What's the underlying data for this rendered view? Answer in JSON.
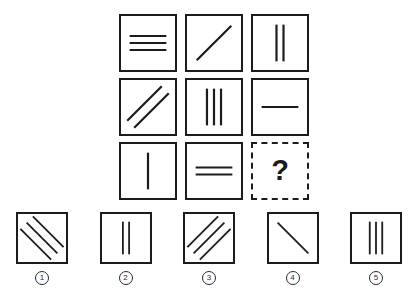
{
  "puzzle": {
    "type": "matrix-reasoning",
    "question_mark": "?",
    "matrix": {
      "rows": 3,
      "cols": 3,
      "cells": [
        {
          "id": "cell-r1c1",
          "orientation": "horizontal",
          "count": 3,
          "label": "3 horizontal lines"
        },
        {
          "id": "cell-r1c2",
          "orientation": "diagonal-up",
          "count": 1,
          "label": "1 diagonal line"
        },
        {
          "id": "cell-r1c3",
          "orientation": "vertical",
          "count": 2,
          "label": "2 vertical lines"
        },
        {
          "id": "cell-r2c1",
          "orientation": "diagonal-up",
          "count": 2,
          "label": "2 diagonal lines"
        },
        {
          "id": "cell-r2c2",
          "orientation": "vertical",
          "count": 3,
          "label": "3 vertical lines"
        },
        {
          "id": "cell-r2c3",
          "orientation": "horizontal",
          "count": 1,
          "label": "1 horizontal line"
        },
        {
          "id": "cell-r3c1",
          "orientation": "vertical",
          "count": 1,
          "label": "1 vertical line"
        },
        {
          "id": "cell-r3c2",
          "orientation": "horizontal",
          "count": 2,
          "label": "2 horizontal lines"
        },
        {
          "id": "cell-r3c3",
          "orientation": "unknown",
          "count": 0,
          "label": "missing cell"
        }
      ]
    },
    "options": [
      {
        "number": "1",
        "orientation": "diagonal-down",
        "count": 3,
        "label": "3 diagonal lines down-right"
      },
      {
        "number": "2",
        "orientation": "vertical",
        "count": 2,
        "label": "2 vertical lines"
      },
      {
        "number": "3",
        "orientation": "diagonal-up",
        "count": 3,
        "label": "3 diagonal lines up-right"
      },
      {
        "number": "4",
        "orientation": "diagonal-down",
        "count": 1,
        "label": "1 diagonal line down-right"
      },
      {
        "number": "5",
        "orientation": "vertical",
        "count": 3,
        "label": "3 vertical lines"
      }
    ]
  },
  "colors": {
    "background": "#ffffff",
    "stroke": "#1c1c1c",
    "number_stroke": "#2a2a2a"
  }
}
